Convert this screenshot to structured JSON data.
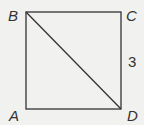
{
  "figure": {
    "shape": "square",
    "vertices": {
      "A": {
        "label": "A",
        "x": 26,
        "y": 109
      },
      "B": {
        "label": "B",
        "x": 26,
        "y": 12
      },
      "C": {
        "label": "C",
        "x": 121,
        "y": 12
      },
      "D": {
        "label": "D",
        "x": 121,
        "y": 109
      }
    },
    "diagonal": "BD",
    "side_label": {
      "side": "CD",
      "text": "3"
    },
    "colors": {
      "line": "#333333",
      "background": "#f1f1ef"
    }
  }
}
